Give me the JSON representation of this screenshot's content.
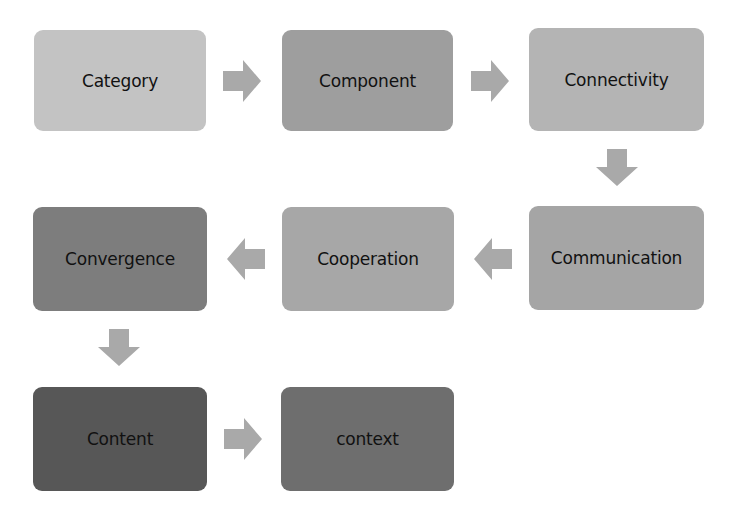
{
  "diagram": {
    "type": "process-flow",
    "nodes": [
      {
        "id": "category",
        "label": "Category",
        "color": "#c3c3c3",
        "x": 34,
        "y": 30,
        "w": 172,
        "h": 101
      },
      {
        "id": "component",
        "label": "Component",
        "color": "#9e9e9e",
        "x": 282,
        "y": 30,
        "w": 171,
        "h": 101
      },
      {
        "id": "connectivity",
        "label": "Connectivity",
        "color": "#b4b4b4",
        "x": 529,
        "y": 28,
        "w": 175,
        "h": 103
      },
      {
        "id": "communication",
        "label": "Communication",
        "color": "#a5a5a5",
        "x": 529,
        "y": 206,
        "w": 175,
        "h": 104
      },
      {
        "id": "cooperation",
        "label": "Cooperation",
        "color": "#a7a7a7",
        "x": 282,
        "y": 207,
        "w": 172,
        "h": 104
      },
      {
        "id": "convergence",
        "label": "Convergence",
        "color": "#7d7d7d",
        "x": 33,
        "y": 207,
        "w": 174,
        "h": 104
      },
      {
        "id": "content",
        "label": "Content",
        "color": "#575757",
        "x": 33,
        "y": 387,
        "w": 174,
        "h": 104
      },
      {
        "id": "context",
        "label": "context",
        "color": "#6e6e6e",
        "x": 281,
        "y": 387,
        "w": 173,
        "h": 104
      }
    ],
    "edges": [
      {
        "from": "category",
        "to": "component",
        "direction": "right",
        "x": 223,
        "y": 60
      },
      {
        "from": "component",
        "to": "connectivity",
        "direction": "right",
        "x": 471,
        "y": 60
      },
      {
        "from": "connectivity",
        "to": "communication",
        "direction": "down",
        "x": 596,
        "y": 149
      },
      {
        "from": "communication",
        "to": "cooperation",
        "direction": "left",
        "x": 474,
        "y": 238
      },
      {
        "from": "cooperation",
        "to": "convergence",
        "direction": "left",
        "x": 227,
        "y": 238
      },
      {
        "from": "convergence",
        "to": "content",
        "direction": "down",
        "x": 98,
        "y": 329
      },
      {
        "from": "content",
        "to": "context",
        "direction": "right",
        "x": 224,
        "y": 418
      }
    ],
    "arrow_color": "#a9a9a9"
  }
}
